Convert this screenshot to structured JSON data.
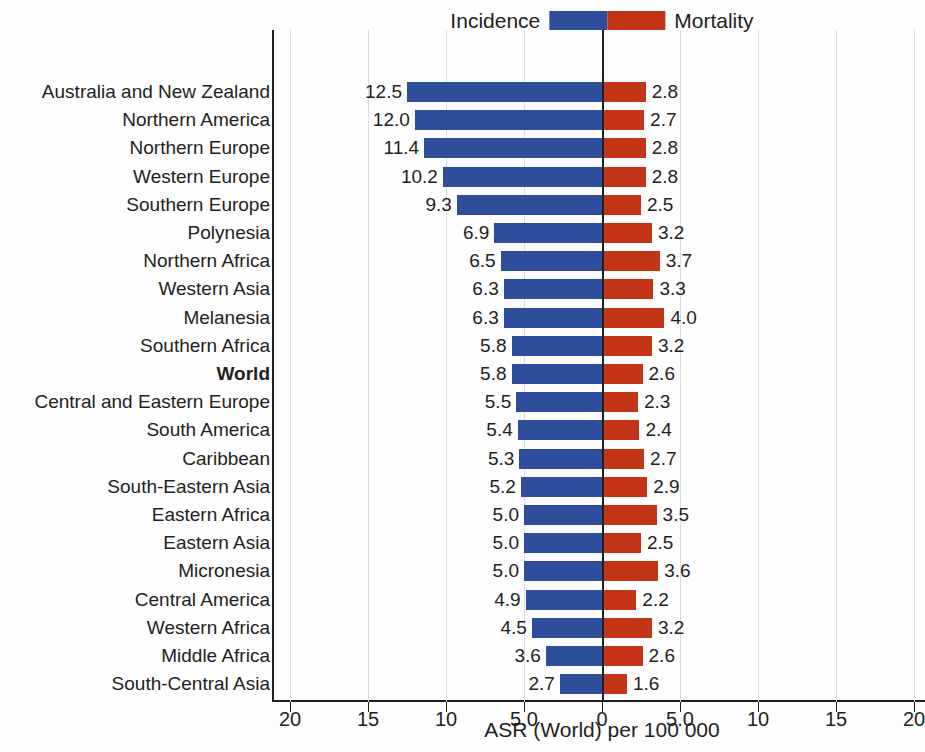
{
  "legend": {
    "left_label": "Incidence",
    "right_label": "Mortality",
    "incidence_color": "#2e4e9c",
    "mortality_color": "#c33516"
  },
  "axis": {
    "title": "ASR (World) per 100 000",
    "tick_labels": [
      "20",
      "15",
      "10",
      "5.0",
      "0",
      "5.0",
      "10",
      "15",
      "20"
    ],
    "tick_values": [
      -20,
      -15,
      -10,
      -5,
      0,
      5,
      10,
      15,
      20
    ]
  },
  "chart_data": {
    "type": "bar",
    "orientation": "horizontal",
    "subtype": "diverging-population-pyramid",
    "title": "",
    "subtitle": "",
    "xlabel": "ASR (World) per 100 000",
    "ylabel": "",
    "xlim": [
      -20,
      20
    ],
    "xticks": [
      -20,
      -15,
      -10,
      -5,
      0,
      5,
      10,
      15,
      20
    ],
    "xticklabels": [
      "20",
      "15",
      "10",
      "5.0",
      "0",
      "5.0",
      "10",
      "15",
      "20"
    ],
    "grid": true,
    "grid_axis": "x",
    "legend": [
      "Incidence",
      "Mortality"
    ],
    "legend_position": "top-center",
    "colors": {
      "Incidence": "#2e4e9c",
      "Mortality": "#c33516"
    },
    "categories": [
      "Australia and New Zealand",
      "Northern America",
      "Northern Europe",
      "Western Europe",
      "Southern Europe",
      "Polynesia",
      "Northern Africa",
      "Western Asia",
      "Melanesia",
      "Southern Africa",
      "World",
      "Central and Eastern Europe",
      "South America",
      "Caribbean",
      "South-Eastern Asia",
      "Eastern Africa",
      "Eastern Asia",
      "Micronesia",
      "Central America",
      "Western Africa",
      "Middle Africa",
      "South-Central Asia"
    ],
    "highlight_category": "World",
    "series": [
      {
        "name": "Incidence",
        "side": "left",
        "values": [
          12.5,
          12.0,
          11.4,
          10.2,
          9.3,
          6.9,
          6.5,
          6.3,
          6.3,
          5.8,
          5.8,
          5.5,
          5.4,
          5.3,
          5.2,
          5.0,
          5.0,
          5.0,
          4.9,
          4.5,
          3.6,
          2.7
        ],
        "labels": [
          "12.5",
          "12.0",
          "11.4",
          "10.2",
          "9.3",
          "6.9",
          "6.5",
          "6.3",
          "6.3",
          "5.8",
          "5.8",
          "5.5",
          "5.4",
          "5.3",
          "5.2",
          "5.0",
          "5.0",
          "5.0",
          "4.9",
          "4.5",
          "3.6",
          "2.7"
        ]
      },
      {
        "name": "Mortality",
        "side": "right",
        "values": [
          2.8,
          2.7,
          2.8,
          2.8,
          2.5,
          3.2,
          3.7,
          3.3,
          4.0,
          3.2,
          2.6,
          2.3,
          2.4,
          2.7,
          2.9,
          3.5,
          2.5,
          3.6,
          2.2,
          3.2,
          2.6,
          1.6
        ],
        "labels": [
          "2.8",
          "2.7",
          "2.8",
          "2.8",
          "2.5",
          "3.2",
          "3.7",
          "3.3",
          "4.0",
          "3.2",
          "2.6",
          "2.3",
          "2.4",
          "2.7",
          "2.9",
          "3.5",
          "2.5",
          "3.6",
          "2.2",
          "3.2",
          "2.6",
          "1.6"
        ]
      }
    ]
  }
}
